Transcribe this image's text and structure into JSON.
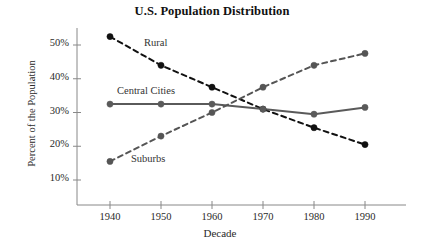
{
  "chart_data": {
    "type": "line",
    "title": "U.S. Population Distribution",
    "xlabel": "Decade",
    "ylabel": "Percent of the Population",
    "categories": [
      "1940",
      "1950",
      "1960",
      "1970",
      "1980",
      "1990"
    ],
    "x": [
      1940,
      1950,
      1960,
      1970,
      1980,
      1990
    ],
    "xlim": [
      1935,
      1995
    ],
    "ylim": [
      5,
      55
    ],
    "yticks": [
      10,
      20,
      30,
      40,
      50
    ],
    "ytick_labels": [
      "10%",
      "20%",
      "30%",
      "40%",
      "50%"
    ],
    "xticks": [
      1940,
      1950,
      1960,
      1970,
      1980,
      1990
    ],
    "grid": false,
    "legend": "inline-annotations",
    "series": [
      {
        "name": "Rural",
        "values": [
          52.5,
          44.0,
          37.5,
          31.0,
          25.5,
          20.5
        ],
        "style": "dashed",
        "color": "#111111",
        "marker": "circle",
        "annotation": {
          "text": "Rural",
          "x_px": 144,
          "y_px": 37
        }
      },
      {
        "name": "Central Cities",
        "values": [
          32.5,
          32.5,
          32.5,
          31.0,
          29.5,
          31.5
        ],
        "style": "solid",
        "color": "#5a5a5a",
        "marker": "circle",
        "annotation": {
          "text": "Central Cities",
          "x_px": 117,
          "y_px": 85
        }
      },
      {
        "name": "Suburbs",
        "values": [
          15.5,
          23.0,
          30.0,
          37.5,
          44.0,
          47.5
        ],
        "style": "dashed",
        "color": "#555555",
        "marker": "circle",
        "annotation": {
          "text": "Suburbs",
          "x_px": 131,
          "y_px": 153
        }
      }
    ]
  },
  "axes": {
    "axis_color": "#888888",
    "tick_color": "#888888"
  }
}
